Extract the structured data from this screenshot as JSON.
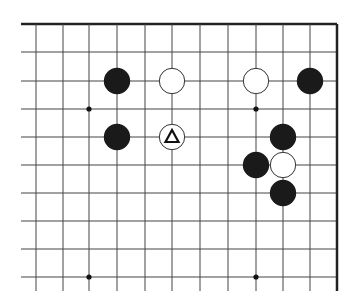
{
  "diagram": {
    "type": "go-board-fragment",
    "edges": {
      "top": true,
      "right": true,
      "left": false,
      "bottom": false
    },
    "columns_x": [
      36,
      63,
      89,
      117,
      145,
      172,
      200,
      228,
      256,
      283,
      310,
      337
    ],
    "rows_y": [
      24,
      52,
      81,
      109,
      137,
      165,
      193,
      221,
      249,
      277
    ],
    "line_extent": {
      "left": 21,
      "bottom": 291
    },
    "colors": {
      "background": "#ffffff",
      "line": "#444444",
      "edge": "#222222",
      "black_stone": "#1a1a1a",
      "white_stone": "#ffffff",
      "stone_outline": "#333333"
    },
    "star_points": [
      {
        "col": 2,
        "row": 3
      },
      {
        "col": 8,
        "row": 3
      },
      {
        "col": 2,
        "row": 9
      },
      {
        "col": 8,
        "row": 9
      }
    ],
    "stones": [
      {
        "color": "black",
        "col": 3,
        "row": 2
      },
      {
        "color": "white",
        "col": 5,
        "row": 2
      },
      {
        "color": "white",
        "col": 8,
        "row": 2
      },
      {
        "color": "black",
        "col": 10,
        "row": 2
      },
      {
        "color": "black",
        "col": 3,
        "row": 4
      },
      {
        "color": "white",
        "col": 5,
        "row": 4,
        "marker": "triangle"
      },
      {
        "color": "black",
        "col": 9,
        "row": 4
      },
      {
        "color": "black",
        "col": 8,
        "row": 5
      },
      {
        "color": "white",
        "col": 9,
        "row": 5
      },
      {
        "color": "black",
        "col": 9,
        "row": 6
      }
    ],
    "marker_label": "Δ"
  }
}
